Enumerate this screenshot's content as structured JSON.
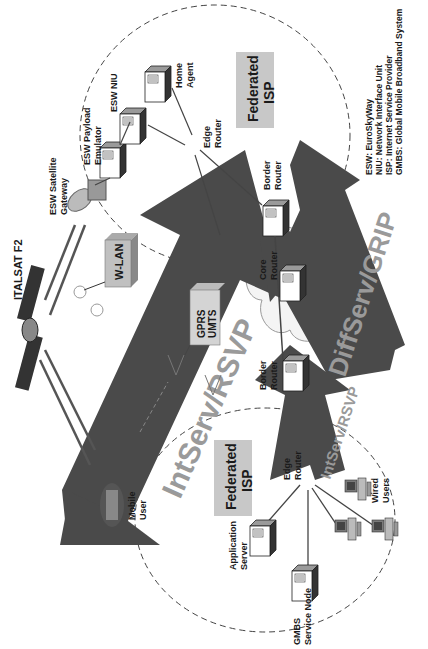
{
  "diagram": {
    "orientation": "rotated-90-ccw",
    "satellite": {
      "label": "ITALSAT F2"
    },
    "top_domain": {
      "isp_label_line1": "Federated",
      "isp_label_line2": "ISP",
      "nodes": {
        "satellite_gateway": {
          "line1": "ESW Satellite",
          "line2": "Gateway"
        },
        "payload_emulator": {
          "line1": "ESW Payload",
          "line2": "Emulator"
        },
        "niu": {
          "line1": "ESW NIU"
        },
        "home_agent": {
          "line1": "Home",
          "line2": "Agent"
        },
        "edge_router": {
          "line1": "Edge",
          "line2": "Router"
        },
        "border_router": {
          "line1": "Border",
          "line2": "Router"
        }
      }
    },
    "access": {
      "wlan": "W-LAN",
      "gprs_line1": "GPRS",
      "gprs_line2": "UMTS"
    },
    "core": {
      "core_router": {
        "line1": "Core",
        "line2": "Router"
      },
      "border_router": {
        "line1": "Border",
        "line2": "Router"
      }
    },
    "bottom_domain": {
      "isp_label_line1": "Federated",
      "isp_label_line2": "ISP",
      "nodes": {
        "edge_router": {
          "line1": "Edge",
          "line2": "Router"
        },
        "application_server": {
          "line1": "Application",
          "line2": "Server"
        },
        "gmbs_node": {
          "line1": "GMBS",
          "line2": "Service Node"
        },
        "wired_users": {
          "line1": "Wired",
          "line2": "Users"
        }
      }
    },
    "mobile_user": {
      "line1": "Mobile",
      "line2": "User"
    },
    "arrows": {
      "intserv_big": "IntServ/RSVP",
      "diffserv": "DiffServ/GRIP",
      "intserv_small": "IntServ/RSVP"
    },
    "legend": [
      "ESW: EuroSkyWay",
      "NIU: Network Interface Unit",
      "ISP: Internet Service Provider",
      "GMBS: Global Mobile Broadband System"
    ],
    "colors": {
      "arrow_fill": "#4a4a4a",
      "arrow_text": "#9a9a9a",
      "isp_box": "#c8c8c8",
      "cloud": "#f2f2f2"
    }
  }
}
